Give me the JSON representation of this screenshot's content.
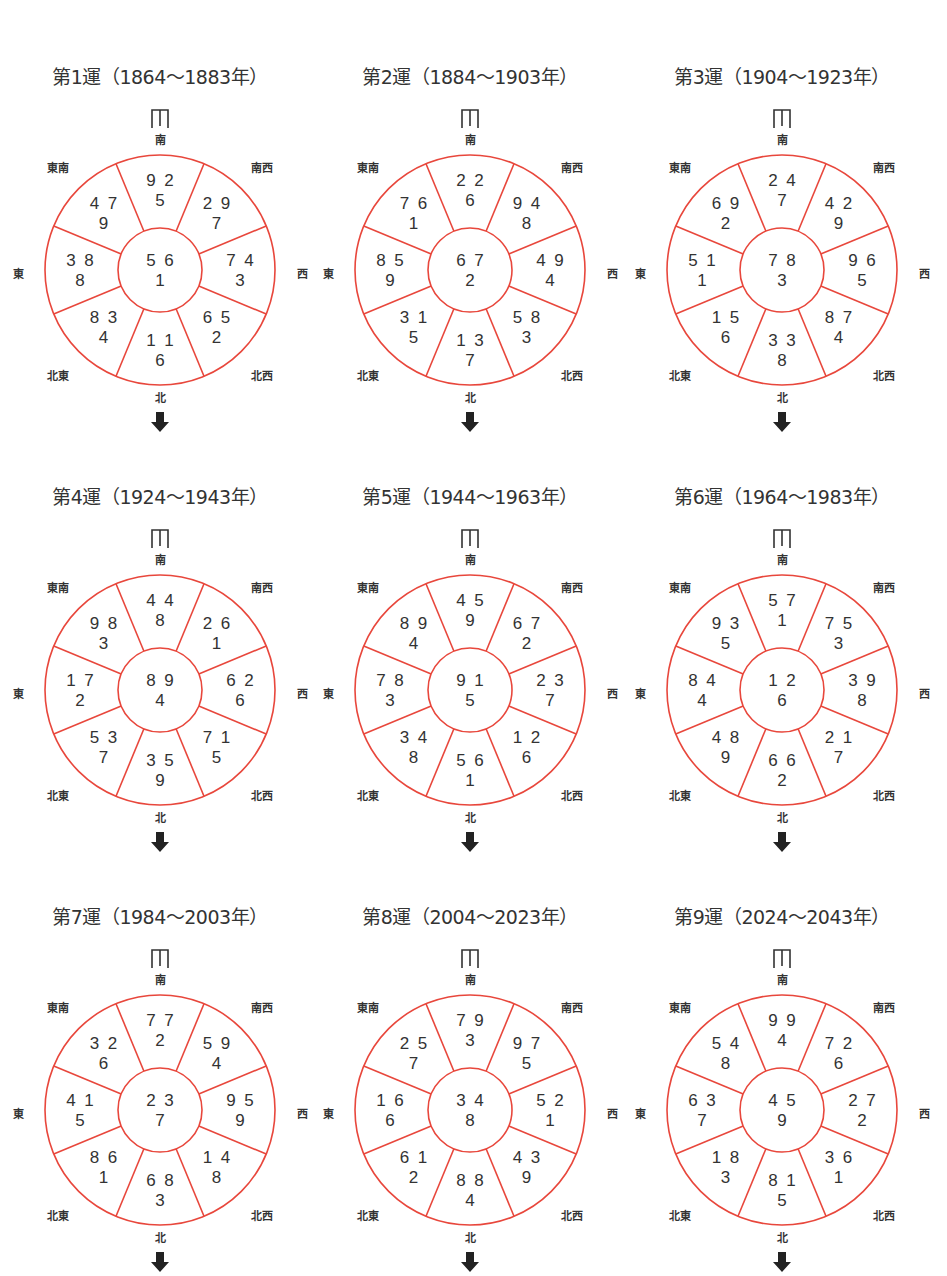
{
  "colors": {
    "line": "#e8473c",
    "text": "#333333",
    "arrow": "#222222"
  },
  "directions": {
    "S": "南",
    "SW": "南西",
    "W": "西",
    "NW": "北西",
    "N": "北",
    "NE": "北東",
    "E": "東",
    "SE": "東南"
  },
  "icons": {
    "door": "door-icon",
    "arrow": "arrow-down-icon"
  },
  "chart_data": [
    {
      "type": "table",
      "title": "第1運（1864～1883年）",
      "center": [
        "5",
        "6",
        "1"
      ],
      "sectors": {
        "S": [
          "9",
          "2",
          "5"
        ],
        "SW": [
          "2",
          "9",
          "7"
        ],
        "W": [
          "7",
          "4",
          "3"
        ],
        "NW": [
          "6",
          "5",
          "2"
        ],
        "N": [
          "1",
          "1",
          "6"
        ],
        "NE": [
          "8",
          "3",
          "4"
        ],
        "E": [
          "3",
          "8",
          "8"
        ],
        "SE": [
          "4",
          "7",
          "9"
        ]
      }
    },
    {
      "type": "table",
      "title": "第2運（1884～1903年）",
      "center": [
        "6",
        "7",
        "2"
      ],
      "sectors": {
        "S": [
          "2",
          "2",
          "6"
        ],
        "SW": [
          "9",
          "4",
          "8"
        ],
        "W": [
          "4",
          "9",
          "4"
        ],
        "NW": [
          "5",
          "8",
          "3"
        ],
        "N": [
          "1",
          "3",
          "7"
        ],
        "NE": [
          "3",
          "1",
          "5"
        ],
        "E": [
          "8",
          "5",
          "9"
        ],
        "SE": [
          "7",
          "6",
          "1"
        ]
      }
    },
    {
      "type": "table",
      "title": "第3運（1904～1923年）",
      "center": [
        "7",
        "8",
        "3"
      ],
      "sectors": {
        "S": [
          "2",
          "4",
          "7"
        ],
        "SW": [
          "4",
          "2",
          "9"
        ],
        "W": [
          "9",
          "6",
          "5"
        ],
        "NW": [
          "8",
          "7",
          "4"
        ],
        "N": [
          "3",
          "3",
          "8"
        ],
        "NE": [
          "1",
          "5",
          "6"
        ],
        "E": [
          "5",
          "1",
          "1"
        ],
        "SE": [
          "6",
          "9",
          "2"
        ]
      }
    },
    {
      "type": "table",
      "title": "第4運（1924～1943年）",
      "center": [
        "8",
        "9",
        "4"
      ],
      "sectors": {
        "S": [
          "4",
          "4",
          "8"
        ],
        "SW": [
          "2",
          "6",
          "1"
        ],
        "W": [
          "6",
          "2",
          "6"
        ],
        "NW": [
          "7",
          "1",
          "5"
        ],
        "N": [
          "3",
          "5",
          "9"
        ],
        "NE": [
          "5",
          "3",
          "7"
        ],
        "E": [
          "1",
          "7",
          "2"
        ],
        "SE": [
          "9",
          "8",
          "3"
        ]
      }
    },
    {
      "type": "table",
      "title": "第5運（1944～1963年）",
      "center": [
        "9",
        "1",
        "5"
      ],
      "sectors": {
        "S": [
          "4",
          "5",
          "9"
        ],
        "SW": [
          "6",
          "7",
          "2"
        ],
        "W": [
          "2",
          "3",
          "7"
        ],
        "NW": [
          "1",
          "2",
          "6"
        ],
        "N": [
          "5",
          "6",
          "1"
        ],
        "NE": [
          "3",
          "4",
          "8"
        ],
        "E": [
          "7",
          "8",
          "3"
        ],
        "SE": [
          "8",
          "9",
          "4"
        ]
      }
    },
    {
      "type": "table",
      "title": "第6運（1964～1983年）",
      "center": [
        "1",
        "2",
        "6"
      ],
      "sectors": {
        "S": [
          "5",
          "7",
          "1"
        ],
        "SW": [
          "7",
          "5",
          "3"
        ],
        "W": [
          "3",
          "9",
          "8"
        ],
        "NW": [
          "2",
          "1",
          "7"
        ],
        "N": [
          "6",
          "6",
          "2"
        ],
        "NE": [
          "4",
          "8",
          "9"
        ],
        "E": [
          "8",
          "4",
          "4"
        ],
        "SE": [
          "9",
          "3",
          "5"
        ]
      }
    },
    {
      "type": "table",
      "title": "第7運（1984～2003年）",
      "center": [
        "2",
        "3",
        "7"
      ],
      "sectors": {
        "S": [
          "7",
          "7",
          "2"
        ],
        "SW": [
          "5",
          "9",
          "4"
        ],
        "W": [
          "9",
          "5",
          "9"
        ],
        "NW": [
          "1",
          "4",
          "8"
        ],
        "N": [
          "6",
          "8",
          "3"
        ],
        "NE": [
          "8",
          "6",
          "1"
        ],
        "E": [
          "4",
          "1",
          "5"
        ],
        "SE": [
          "3",
          "2",
          "6"
        ]
      }
    },
    {
      "type": "table",
      "title": "第8運（2004～2023年）",
      "center": [
        "3",
        "4",
        "8"
      ],
      "sectors": {
        "S": [
          "7",
          "9",
          "3"
        ],
        "SW": [
          "9",
          "7",
          "5"
        ],
        "W": [
          "5",
          "2",
          "1"
        ],
        "NW": [
          "4",
          "3",
          "9"
        ],
        "N": [
          "8",
          "8",
          "4"
        ],
        "NE": [
          "6",
          "1",
          "2"
        ],
        "E": [
          "1",
          "6",
          "6"
        ],
        "SE": [
          "2",
          "5",
          "7"
        ]
      }
    },
    {
      "type": "table",
      "title": "第9運（2024～2043年）",
      "center": [
        "4",
        "5",
        "9"
      ],
      "sectors": {
        "S": [
          "9",
          "9",
          "4"
        ],
        "SW": [
          "7",
          "2",
          "6"
        ],
        "W": [
          "2",
          "7",
          "2"
        ],
        "NW": [
          "3",
          "6",
          "1"
        ],
        "N": [
          "8",
          "1",
          "5"
        ],
        "NE": [
          "1",
          "8",
          "3"
        ],
        "E": [
          "6",
          "3",
          "7"
        ],
        "SE": [
          "5",
          "4",
          "8"
        ]
      }
    }
  ]
}
